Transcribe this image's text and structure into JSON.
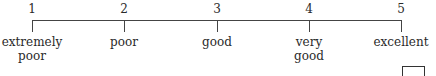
{
  "scale": {
    "points": [
      {
        "number": "1",
        "label_line1": "extremely",
        "label_line2": "poor",
        "x": 32
      },
      {
        "number": "2",
        "label_line1": "poor",
        "label_line2": "",
        "x": 124
      },
      {
        "number": "3",
        "label_line1": "good",
        "label_line2": "",
        "x": 217
      },
      {
        "number": "4",
        "label_line1": "very",
        "label_line2": "good",
        "x": 309
      },
      {
        "number": "5",
        "label_line1": "excellent",
        "label_line2": "",
        "x": 401
      }
    ]
  },
  "answer_box": {
    "value": ""
  }
}
